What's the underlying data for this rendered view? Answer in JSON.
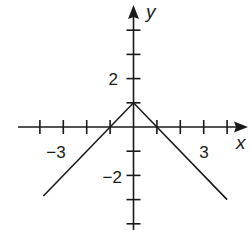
{
  "chart_data": {
    "type": "line",
    "title": "",
    "function": "y = 1 - |x|",
    "xlabel": "x",
    "ylabel": "y",
    "xlim": [
      -4.1,
      4.8
    ],
    "ylim": [
      -4.1,
      5.1
    ],
    "grid": false,
    "legend": null,
    "x_ticks": [
      -4,
      -3,
      -2,
      -1,
      1,
      2,
      3,
      4
    ],
    "y_ticks": [
      -4,
      -3,
      -2,
      -1,
      1,
      2,
      3,
      4
    ],
    "x_tick_labels": [
      {
        "value": -3,
        "text": "−3"
      },
      {
        "value": 3,
        "text": "3"
      }
    ],
    "y_tick_labels": [
      {
        "value": 2,
        "text": "2"
      },
      {
        "value": -2,
        "text": "−2"
      }
    ],
    "series": [
      {
        "name": "y = 1 - |x|",
        "x": [
          -3.85,
          0,
          4.0
        ],
        "y": [
          -2.85,
          1,
          -3.0
        ]
      }
    ],
    "key_points": {
      "vertex": [
        0,
        1
      ],
      "x_intercepts": [
        [
          -1,
          0
        ],
        [
          1,
          0
        ]
      ]
    }
  },
  "labels": {
    "x_axis": "x",
    "y_axis": "y",
    "x_neg3": "−3",
    "x_pos3": "3",
    "y_pos2": "2",
    "y_neg2": "−2"
  },
  "colors": {
    "ink": "#1a1a1a",
    "background": "#ffffff"
  }
}
